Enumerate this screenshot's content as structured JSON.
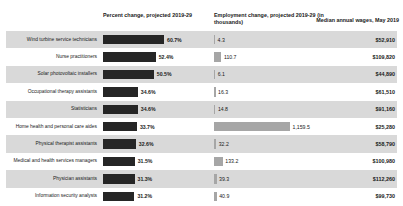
{
  "header": {
    "percent_change": "Percent change, projected 2019-29",
    "employment_change": "Employment change, projected 2019-29 (in thousands)",
    "median_wage": "Median annual wages, May 2019"
  },
  "colors": {
    "percent_bar": "#262626",
    "employment_bar": "#a6a6a6",
    "stripe": "#d9d9d9",
    "background": "#ffffff",
    "text": "#1a1a1a"
  },
  "chart_data": {
    "type": "bar",
    "xlabel": "",
    "ylabel": "",
    "grid": false,
    "legend": "none",
    "categories": [
      "Wind turbine service technicians",
      "Nurse practitioners",
      "Solar photovoltaic installers",
      "Occupational therapy assistants",
      "Statisticians",
      "Home health and personal care aides",
      "Physical therapist assistants",
      "Medical and health services managers",
      "Physician assistants",
      "Information security analysts"
    ],
    "series": [
      {
        "name": "Percent change, projected 2019-29",
        "unit": "%",
        "max": 60.7,
        "values": [
          60.7,
          52.4,
          50.5,
          34.6,
          34.6,
          33.7,
          32.6,
          31.5,
          31.3,
          31.2
        ],
        "labels": [
          "60.7%",
          "52.4%",
          "50.5%",
          "34.6%",
          "34.6%",
          "33.7%",
          "32.6%",
          "31.5%",
          "31.3%",
          "31.2%"
        ]
      },
      {
        "name": "Employment change, projected 2019-29 (in thousands)",
        "unit": "thousands",
        "max": 1159.5,
        "values": [
          4.3,
          110.7,
          6.1,
          16.3,
          14.8,
          1159.5,
          32.2,
          133.2,
          39.3,
          40.9
        ],
        "labels": [
          "4.3",
          "110.7",
          "6.1",
          "16.3",
          "14.8",
          "1,159.5",
          "32.2",
          "133.2",
          "39.3",
          "40.9"
        ]
      }
    ],
    "wages": {
      "name": "Median annual wages, May 2019",
      "values": [
        52910,
        109820,
        44890,
        61510,
        91160,
        25280,
        58790,
        100980,
        112260,
        99730
      ],
      "labels": [
        "$52,910",
        "$109,820",
        "$44,890",
        "$61,510",
        "$91,160",
        "$25,280",
        "$58,790",
        "$100,980",
        "$112,260",
        "$99,730"
      ]
    }
  },
  "rows": [
    {
      "occupation": "Wind turbine service technicians",
      "pct": "60.7%",
      "pct_w": 61.0,
      "emp": "4.3",
      "emp_w": 1.1,
      "wage": "$52,910"
    },
    {
      "occupation": "Nurse practitioners",
      "pct": "52.4%",
      "pct_w": 52.7,
      "emp": "110.7",
      "emp_w": 7.4,
      "wage": "$109,820"
    },
    {
      "occupation": "Solar photovoltaic installers",
      "pct": "50.5%",
      "pct_w": 50.8,
      "emp": "6.1",
      "emp_w": 1.2,
      "wage": "$44,890"
    },
    {
      "occupation": "Occupational therapy assistants",
      "pct": "34.6%",
      "pct_w": 34.8,
      "emp": "16.3",
      "emp_w": 1.5,
      "wage": "$61,510"
    },
    {
      "occupation": "Statisticians",
      "pct": "34.6%",
      "pct_w": 34.8,
      "emp": "14.8",
      "emp_w": 1.4,
      "wage": "$91,160"
    },
    {
      "occupation": "Home health and personal care aides",
      "pct": "33.7%",
      "pct_w": 33.9,
      "emp": "1,159.5",
      "emp_w": 76.0,
      "wage": "$25,280"
    },
    {
      "occupation": "Physical therapist assistants",
      "pct": "32.6%",
      "pct_w": 32.8,
      "emp": "32.2",
      "emp_w": 2.2,
      "wage": "$58,790"
    },
    {
      "occupation": "Medical and health services managers",
      "pct": "31.5%",
      "pct_w": 31.7,
      "emp": "133.2",
      "emp_w": 8.8,
      "wage": "$100,980"
    },
    {
      "occupation": "Physician assistants",
      "pct": "31.3%",
      "pct_w": 31.5,
      "emp": "39.3",
      "emp_w": 2.6,
      "wage": "$112,260"
    },
    {
      "occupation": "Information security analysts",
      "pct": "31.2%",
      "pct_w": 31.4,
      "emp": "40.9",
      "emp_w": 2.7,
      "wage": "$99,730"
    }
  ]
}
